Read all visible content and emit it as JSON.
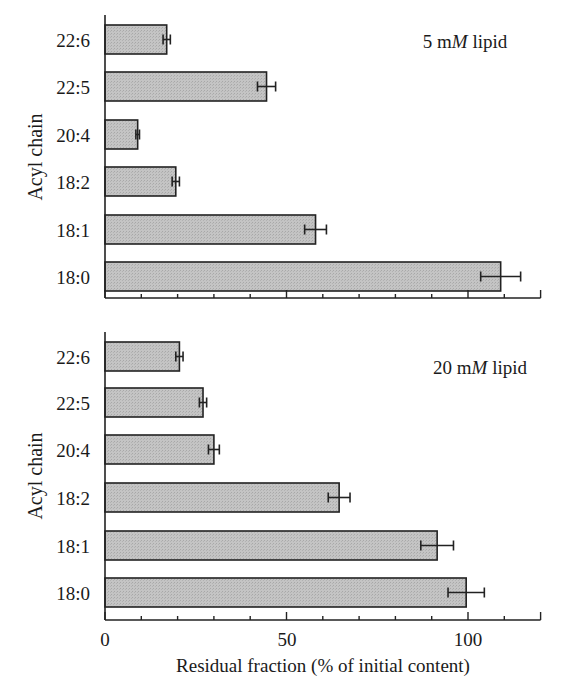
{
  "chart_data": [
    {
      "type": "bar",
      "orientation": "horizontal",
      "annotation": "5 mM lipid",
      "ylabel": "Acyl chain",
      "xlabel": "",
      "categories": [
        "22:6",
        "22:5",
        "20:4",
        "18:2",
        "18:1",
        "18:0"
      ],
      "values": [
        17,
        44.5,
        9,
        19.5,
        58,
        109
      ],
      "errors": [
        1,
        2.5,
        0.5,
        1,
        3,
        5.5
      ],
      "xlim": [
        0,
        120
      ],
      "xticks_major": [
        0,
        50,
        100
      ],
      "xticks_minor_step": 10,
      "xtick_labels_shown": false,
      "grid": false
    },
    {
      "type": "bar",
      "orientation": "horizontal",
      "annotation": "20 mM lipid",
      "ylabel": "Acyl chain",
      "xlabel": "Residual fraction (% of initial content)",
      "categories": [
        "22:6",
        "22:5",
        "20:4",
        "18:2",
        "18:1",
        "18:0"
      ],
      "values": [
        20.5,
        27,
        30,
        64.5,
        91.5,
        99.5
      ],
      "errors": [
        1,
        1,
        1.5,
        3,
        4.5,
        5
      ],
      "xlim": [
        0,
        120
      ],
      "xticks_major": [
        0,
        50,
        100
      ],
      "xticks_minor_step": 10,
      "xtick_labels_shown": true,
      "grid": false
    }
  ],
  "panels": [
    {
      "annotation_prefix": "5 m",
      "annotation_italic": "M",
      "annotation_suffix": " lipid",
      "ylabel": "Acyl chain"
    },
    {
      "annotation_prefix": "20 m",
      "annotation_italic": "M",
      "annotation_suffix": " lipid",
      "ylabel": "Acyl chain"
    }
  ],
  "x_axis": {
    "tick_labels": [
      "0",
      "50",
      "100"
    ],
    "label": "Residual fraction (% of initial content)"
  },
  "colors": {
    "bar_fill": "#bdbdbd",
    "bar_stroke": "#222222",
    "axis": "#222222"
  }
}
